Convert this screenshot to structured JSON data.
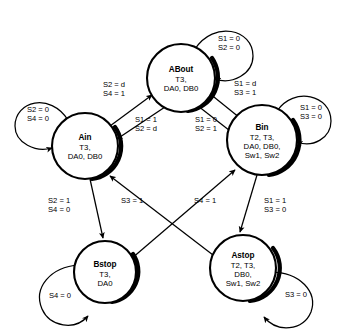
{
  "diagram": {
    "type": "finite-state-machine",
    "background_color": "#ffffff",
    "line_color": "#000000",
    "states": [
      {
        "id": "ABout",
        "name": "ABout",
        "outputs": [
          "T3,",
          "DA0, DB0"
        ],
        "cx": 181,
        "cy": 78,
        "r": 34
      },
      {
        "id": "Ain",
        "name": "Ain",
        "outputs": [
          "T3,",
          "DA0, DB0"
        ],
        "cx": 85,
        "cy": 146,
        "r": 33
      },
      {
        "id": "Bin",
        "name": "Bin",
        "outputs": [
          "T2, T3,",
          "DA0, DB0,",
          "Sw1, Sw2"
        ],
        "cx": 262,
        "cy": 140,
        "r": 35
      },
      {
        "id": "Bstop",
        "name": "Bstop",
        "outputs": [
          "T3,",
          "DA0"
        ],
        "cx": 105,
        "cy": 272,
        "r": 31
      },
      {
        "id": "Astop",
        "name": "Astop",
        "outputs": [
          "T2, T3,",
          "DB0,",
          "Sw1, Sw2"
        ],
        "cx": 243,
        "cy": 268,
        "r": 33
      }
    ],
    "self_loops": [
      {
        "id": "loop-about",
        "state": "ABout",
        "conditions": [
          "S1 = 0",
          "S2 = 0"
        ],
        "label_x": 229,
        "label_y": 41
      },
      {
        "id": "loop-ain",
        "state": "Ain",
        "conditions": [
          "S2 = 0",
          "S4 = 0"
        ],
        "label_x": 38,
        "label_y": 105
      },
      {
        "id": "loop-bin",
        "state": "Bin",
        "conditions": [
          "S1 = 0",
          "S3 = 0"
        ],
        "label_x": 311,
        "label_y": 110
      },
      {
        "id": "loop-bstop",
        "state": "Bstop",
        "conditions": [
          "S4 = 0"
        ],
        "label_x": 60,
        "label_y": 296
      },
      {
        "id": "loop-astop",
        "state": "Astop",
        "conditions": [
          "S3 = 0"
        ],
        "label_x": 296,
        "label_y": 295
      }
    ],
    "transitions": [
      {
        "id": "ain-to-about",
        "from": "Ain",
        "to": "ABout",
        "conditions": [
          "S2 = d",
          "S4 = 1"
        ],
        "label_x": 114,
        "label_y": 87
      },
      {
        "id": "about-to-ain",
        "from": "ABout",
        "to": "Ain",
        "conditions": [
          "S1 = 1",
          "S2 = d"
        ],
        "label_x": 146,
        "label_y": 122
      },
      {
        "id": "about-to-bin",
        "from": "ABout",
        "to": "Bin",
        "conditions": [
          "S1 = 0",
          "S2 = 1"
        ],
        "label_x": 206,
        "label_y": 122
      },
      {
        "id": "bin-to-about",
        "from": "Bin",
        "to": "ABout",
        "conditions": [
          "S1 = d",
          "S3 = 1"
        ],
        "label_x": 240,
        "label_y": 86
      },
      {
        "id": "ain-to-bstop",
        "from": "Ain",
        "to": "Bstop",
        "conditions": [
          "S2 = 1",
          "S4 = 0"
        ],
        "label_x": 74,
        "label_y": 203
      },
      {
        "id": "astop-to-ain",
        "from": "Astop",
        "to": "Ain",
        "conditions": [
          "S3 = 1"
        ],
        "label_x": 133,
        "label_y": 203
      },
      {
        "id": "bstop-to-bin",
        "from": "Bstop",
        "to": "Bin",
        "conditions": [
          "S4 = 1"
        ],
        "label_x": 206,
        "label_y": 203
      },
      {
        "id": "bin-to-astop",
        "from": "Bin",
        "to": "Astop",
        "conditions": [
          "S1 = 1",
          "S3 = 0"
        ],
        "label_x": 272,
        "label_y": 203
      }
    ]
  }
}
